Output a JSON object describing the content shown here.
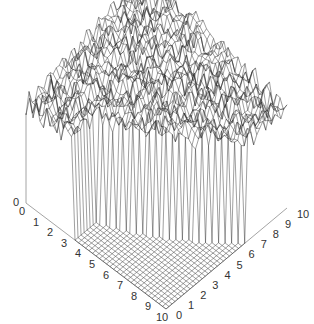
{
  "chart_data": {
    "type": "surface3d",
    "title": "",
    "xlabel": "",
    "ylabel": "",
    "zlabel": "",
    "x_axis": {
      "ticks": [
        "0",
        "1",
        "2",
        "3",
        "4",
        "5",
        "6",
        "7",
        "8",
        "9",
        "10"
      ],
      "range": [
        0,
        10
      ]
    },
    "y_axis": {
      "ticks": [
        "0",
        "1",
        "2",
        "3",
        "4",
        "5",
        "6",
        "7",
        "8",
        "9",
        "10"
      ],
      "range": [
        0,
        10
      ]
    },
    "z_axis": {
      "ticks": [
        "0"
      ]
    },
    "grid_resolution": 40,
    "style": {
      "mesh_color": "#2b2b2b",
      "axis_color": "#9a9a9a",
      "background": "#ffffff"
    }
  },
  "labels": {
    "left_axis": [
      "0",
      "1",
      "2",
      "3",
      "4",
      "5",
      "6",
      "7",
      "8",
      "9",
      "10"
    ],
    "right_axis": [
      "0",
      "1",
      "2",
      "3",
      "4",
      "5",
      "6",
      "7",
      "8",
      "9",
      "10"
    ]
  }
}
